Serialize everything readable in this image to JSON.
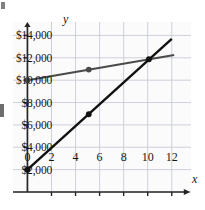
{
  "chart_data": {
    "type": "line",
    "title": "",
    "subtitle": "",
    "xlabel": "x",
    "ylabel": "y",
    "xlim": [
      -1.2,
      13.6
    ],
    "ylim": [
      0,
      15200
    ],
    "grid": true,
    "grid_x_step": 2,
    "grid_y_step": 2000,
    "legend": "none",
    "x_ticks": [
      0,
      2,
      4,
      6,
      8,
      10,
      12
    ],
    "x_tick_labels": [
      "0",
      "2",
      "4",
      "6",
      "8",
      "10",
      "12"
    ],
    "y_ticks": [
      2000,
      4000,
      6000,
      8000,
      10000,
      12000,
      14000
    ],
    "y_tick_labels": [
      "$2,000",
      "$4,000",
      "$6,000",
      "$8,000",
      "$10,000",
      "$12,000",
      "$14,000"
    ],
    "series": [
      {
        "name": "shallow-line",
        "color": "#4a4a4a",
        "width": 2.0,
        "x": [
          0,
          12.2
        ],
        "y": [
          10000,
          12250
        ],
        "markers": [
          {
            "x": 0,
            "y": 10000
          },
          {
            "x": 5.1,
            "y": 10950
          }
        ]
      },
      {
        "name": "steep-line",
        "color": "#111111",
        "width": 2.4,
        "x": [
          0,
          12.0
        ],
        "y": [
          2000,
          13700
        ],
        "markers": [
          {
            "x": 0,
            "y": 2000
          },
          {
            "x": 5.1,
            "y": 6950
          }
        ]
      }
    ],
    "intersection": {
      "x": 10.1,
      "y": 11870
    },
    "annotations": []
  },
  "axes": {
    "y_axis_name": "y",
    "x_axis_name": "x"
  },
  "colors": {
    "grid": "#c9ccd6",
    "axis": "#262626",
    "steep_line": "#111111",
    "shallow_line": "#4a4a4a",
    "background": "#ffffff",
    "plot_background": "#fbfbfc"
  }
}
